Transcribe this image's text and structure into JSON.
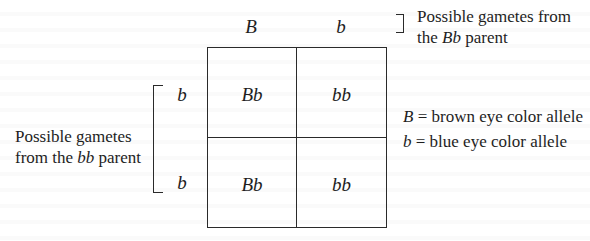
{
  "diagram": {
    "type": "punnett-square",
    "column_parent": {
      "caption_prefix": "Possible gametes from",
      "caption_line2_prefix": "the ",
      "caption_genotype": "Bb",
      "caption_line2_suffix": " parent",
      "gametes": [
        "B",
        "b"
      ]
    },
    "row_parent": {
      "caption_line1": "Possible gametes",
      "caption_line2_prefix": "from the ",
      "caption_genotype": "bb",
      "caption_line2_suffix": " parent",
      "gametes": [
        "b",
        "b"
      ]
    },
    "cells": [
      [
        "Bb",
        "bb"
      ],
      [
        "Bb",
        "bb"
      ]
    ],
    "legend": [
      {
        "symbol": "B",
        "separator": " = ",
        "meaning": "brown eye color allele"
      },
      {
        "symbol": "b",
        "separator": " = ",
        "meaning": "blue eye color allele"
      }
    ],
    "colors": {
      "text": "#1e1e1e",
      "lines": "#2a2a2a",
      "background": "#ffffff"
    }
  }
}
